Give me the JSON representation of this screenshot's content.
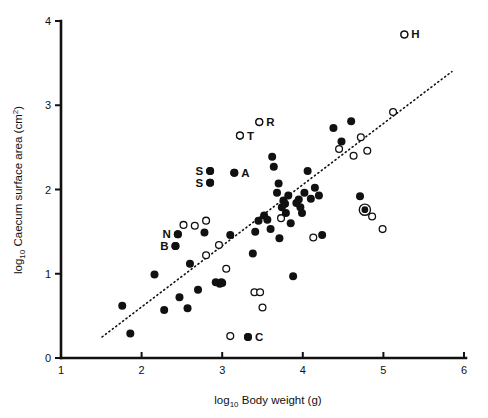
{
  "figure": {
    "background_color": "#ffffff",
    "ink_color": "#111111"
  },
  "axes": {
    "x": {
      "title_prefix": "log",
      "title_sub": "10",
      "title_main": " Body weight (g)",
      "ticks": [
        "1",
        "2",
        "3",
        "4",
        "5",
        "6"
      ],
      "min": 1,
      "max": 6
    },
    "y": {
      "title_prefix": "log",
      "title_sub": "10",
      "title_main": " Caecum surface area (cm",
      "title_sup": "2",
      "title_suffix": ")",
      "ticks": [
        "0",
        "1",
        "2",
        "3",
        "4"
      ],
      "min": 0,
      "max": 4
    }
  },
  "chart_data": {
    "type": "scatter",
    "title": "",
    "xlabel": "log10 Body weight (g)",
    "ylabel": "log10 Caecum surface area (cm2)",
    "xlim": [
      1,
      6
    ],
    "ylim": [
      0,
      4
    ],
    "grid": false,
    "legend": "none",
    "marker_types": {
      "filled": "filled black circle",
      "open": "open white circle with black outline",
      "bullseye": "filled black circle with outer black ring"
    },
    "fit_line": {
      "style": "dotted",
      "x_start": 1.51,
      "y_start": 0.25,
      "x_end": 5.85,
      "y_end": 3.4
    },
    "annotations": [
      {
        "label": "H",
        "x": 5.26,
        "y": 3.84,
        "marker": "open",
        "label_side": "right"
      },
      {
        "label": "R",
        "x": 3.46,
        "y": 2.8,
        "marker": "open",
        "label_side": "right"
      },
      {
        "label": "T",
        "x": 3.22,
        "y": 2.64,
        "marker": "open",
        "label_side": "right"
      },
      {
        "label": "A",
        "x": 3.15,
        "y": 2.2,
        "marker": "filled",
        "label_side": "right"
      },
      {
        "label": "S",
        "x": 2.85,
        "y": 2.22,
        "marker": "filled",
        "label_side": "left"
      },
      {
        "label": "S",
        "x": 2.85,
        "y": 2.08,
        "marker": "filled",
        "label_side": "left"
      },
      {
        "label": "N",
        "x": 2.45,
        "y": 1.47,
        "marker": "filled",
        "label_side": "left"
      },
      {
        "label": "B",
        "x": 2.42,
        "y": 1.33,
        "marker": "filled",
        "label_side": "left"
      },
      {
        "label": "C",
        "x": 3.32,
        "y": 0.25,
        "marker": "filled",
        "label_side": "right"
      }
    ],
    "points_filled": [
      {
        "x": 1.76,
        "y": 0.62
      },
      {
        "x": 1.86,
        "y": 0.29
      },
      {
        "x": 2.16,
        "y": 0.99
      },
      {
        "x": 2.28,
        "y": 0.57
      },
      {
        "x": 2.42,
        "y": 1.33
      },
      {
        "x": 2.45,
        "y": 1.47
      },
      {
        "x": 2.47,
        "y": 0.72
      },
      {
        "x": 2.57,
        "y": 0.59
      },
      {
        "x": 2.6,
        "y": 1.12
      },
      {
        "x": 2.7,
        "y": 0.81
      },
      {
        "x": 2.78,
        "y": 1.49
      },
      {
        "x": 2.85,
        "y": 2.08
      },
      {
        "x": 2.85,
        "y": 2.22
      },
      {
        "x": 2.92,
        "y": 0.9
      },
      {
        "x": 2.97,
        "y": 0.88
      },
      {
        "x": 2.99,
        "y": 0.9
      },
      {
        "x": 3.0,
        "y": 0.89
      },
      {
        "x": 3.1,
        "y": 1.46
      },
      {
        "x": 3.15,
        "y": 2.2
      },
      {
        "x": 3.32,
        "y": 0.25
      },
      {
        "x": 3.38,
        "y": 1.24
      },
      {
        "x": 3.41,
        "y": 1.5
      },
      {
        "x": 3.45,
        "y": 1.63
      },
      {
        "x": 3.52,
        "y": 1.69
      },
      {
        "x": 3.56,
        "y": 1.64
      },
      {
        "x": 3.6,
        "y": 1.53
      },
      {
        "x": 3.62,
        "y": 2.39
      },
      {
        "x": 3.64,
        "y": 2.27
      },
      {
        "x": 3.68,
        "y": 1.96
      },
      {
        "x": 3.7,
        "y": 2.07
      },
      {
        "x": 3.71,
        "y": 1.42
      },
      {
        "x": 3.74,
        "y": 1.79
      },
      {
        "x": 3.76,
        "y": 1.87
      },
      {
        "x": 3.78,
        "y": 1.83
      },
      {
        "x": 3.79,
        "y": 1.72
      },
      {
        "x": 3.82,
        "y": 1.93
      },
      {
        "x": 3.85,
        "y": 1.6
      },
      {
        "x": 3.88,
        "y": 0.97
      },
      {
        "x": 3.92,
        "y": 1.84
      },
      {
        "x": 3.95,
        "y": 1.88
      },
      {
        "x": 3.97,
        "y": 1.79
      },
      {
        "x": 3.99,
        "y": 1.72
      },
      {
        "x": 4.02,
        "y": 1.96
      },
      {
        "x": 4.06,
        "y": 2.22
      },
      {
        "x": 4.1,
        "y": 1.89
      },
      {
        "x": 4.15,
        "y": 2.02
      },
      {
        "x": 4.2,
        "y": 1.93
      },
      {
        "x": 4.24,
        "y": 1.46
      },
      {
        "x": 4.38,
        "y": 2.73
      },
      {
        "x": 4.48,
        "y": 2.57
      },
      {
        "x": 4.6,
        "y": 2.81
      },
      {
        "x": 4.71,
        "y": 1.92
      }
    ],
    "points_open": [
      {
        "x": 2.52,
        "y": 1.58
      },
      {
        "x": 2.66,
        "y": 1.57
      },
      {
        "x": 2.8,
        "y": 1.63
      },
      {
        "x": 2.8,
        "y": 1.22
      },
      {
        "x": 2.96,
        "y": 1.34
      },
      {
        "x": 3.05,
        "y": 1.06
      },
      {
        "x": 3.1,
        "y": 0.26
      },
      {
        "x": 3.22,
        "y": 2.64
      },
      {
        "x": 3.4,
        "y": 0.78
      },
      {
        "x": 3.46,
        "y": 2.8
      },
      {
        "x": 3.47,
        "y": 0.78
      },
      {
        "x": 3.5,
        "y": 0.6
      },
      {
        "x": 3.73,
        "y": 1.66
      },
      {
        "x": 4.13,
        "y": 1.43
      },
      {
        "x": 4.45,
        "y": 2.48
      },
      {
        "x": 4.63,
        "y": 2.4
      },
      {
        "x": 4.72,
        "y": 2.62
      },
      {
        "x": 4.8,
        "y": 2.46
      },
      {
        "x": 4.86,
        "y": 1.68
      },
      {
        "x": 4.99,
        "y": 1.53
      },
      {
        "x": 5.12,
        "y": 2.92
      },
      {
        "x": 5.26,
        "y": 3.84
      }
    ],
    "points_bullseye": [
      {
        "x": 4.77,
        "y": 1.76
      }
    ]
  }
}
